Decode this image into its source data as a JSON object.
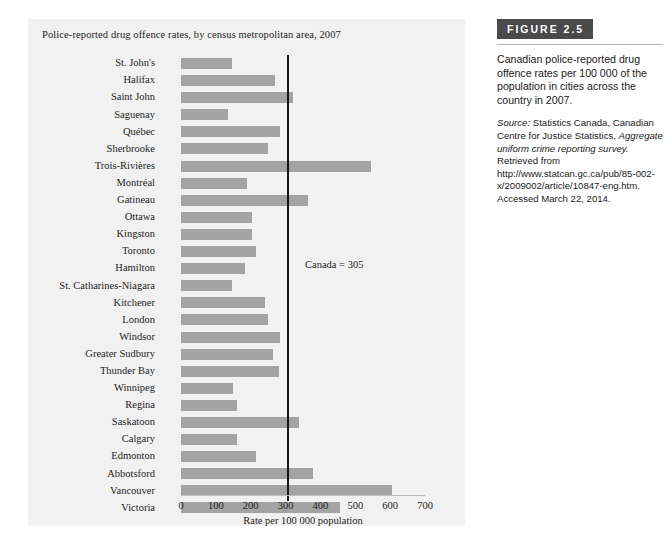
{
  "chart": {
    "title": "Police-reported drug offence rates, by census metropolitan area, 2007",
    "xlabel": "Rate per 100 000 population",
    "reference_label": "Canada = 305"
  },
  "figure": {
    "badge": "FIGURE 2.5",
    "caption": "Canadian police-reported drug offence rates per 100 000 of the population in cities across the country in 2007.",
    "source_prefix": "Source:",
    "source_part1": " Statistics Canada, Canadian Centre for Justice Statistics, ",
    "source_italic": "Aggregate uniform crime reporting survey.",
    "source_part2": " Retrieved from http://www.statcan.gc.ca/pub/85-002-x/2009002/article/10847-eng.htm. Accessed March 22, 2014."
  },
  "colors": {
    "bar": "#a3a3a3",
    "panel_background": "#f1f1f1",
    "reference_line": "#161616",
    "badge_background": "#4a4a4a"
  },
  "chart_data": {
    "type": "bar",
    "orientation": "horizontal",
    "title": "Police-reported drug offence rates, by census metropolitan area, 2007",
    "xlabel": "Rate per 100 000 population",
    "ylabel": "",
    "xlim": [
      0,
      700
    ],
    "xticks": [
      0,
      100,
      200,
      300,
      400,
      500,
      600,
      700
    ],
    "grid": false,
    "legend": "none",
    "reference_line": {
      "label": "Canada = 305",
      "value": 305
    },
    "categories": [
      "St. John's",
      "Halifax",
      "Saint John",
      "Saguenay",
      "Québec",
      "Sherbrooke",
      "Trois-Rivières",
      "Montréal",
      "Gatineau",
      "Ottawa",
      "Kingston",
      "Toronto",
      "Hamilton",
      "St. Catharines-Niagara",
      "Kitchener",
      "London",
      "Windsor",
      "Greater Sudbury",
      "Thunder Bay",
      "Winnipeg",
      "Regina",
      "Saskatoon",
      "Calgary",
      "Edmonton",
      "Abbotsford",
      "Vancouver",
      "Victoria"
    ],
    "values": [
      145,
      270,
      320,
      135,
      285,
      250,
      545,
      190,
      365,
      205,
      205,
      215,
      185,
      145,
      240,
      250,
      285,
      265,
      280,
      150,
      162,
      338,
      160,
      215,
      380,
      605,
      455
    ]
  }
}
